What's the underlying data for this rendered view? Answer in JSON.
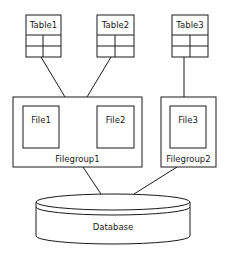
{
  "diagram": {
    "tables": [
      {
        "label": "Table1"
      },
      {
        "label": "Table2"
      },
      {
        "label": "Table3"
      }
    ],
    "filegroups": [
      {
        "label": "Filegroup1",
        "files": [
          {
            "label": "File1"
          },
          {
            "label": "File2"
          }
        ]
      },
      {
        "label": "Filegroup2",
        "files": [
          {
            "label": "File3"
          }
        ]
      }
    ],
    "database": {
      "label": "Database"
    },
    "colors": {
      "stroke": "#1a1a1a",
      "fill": "#ffffff"
    }
  }
}
